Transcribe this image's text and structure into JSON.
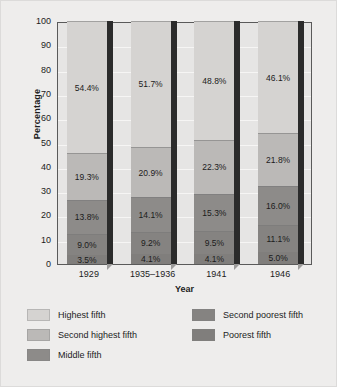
{
  "chart_data": {
    "type": "bar",
    "subtype": "stacked-column-3d",
    "title": "",
    "xlabel": "Year",
    "ylabel": "Percentage",
    "ylim": [
      0,
      100
    ],
    "yticks": [
      0,
      10,
      20,
      30,
      40,
      50,
      60,
      70,
      80,
      90,
      100
    ],
    "ytick_labels": [
      "0",
      "10",
      "20",
      "30",
      "40",
      "50",
      "60",
      "70",
      "80",
      "90",
      "100"
    ],
    "grid": true,
    "legend_position": "bottom",
    "categories": [
      "1929",
      "1935–1936",
      "1941",
      "1946"
    ],
    "series": [
      {
        "name": "Highest fifth",
        "color": "#d5d3d1",
        "values": [
          54.4,
          51.7,
          48.8,
          46.1
        ],
        "labels": [
          "54.4%",
          "51.7%",
          "48.8%",
          "46.1%"
        ]
      },
      {
        "name": "Second highest fifth",
        "color": "#bbb9b7",
        "values": [
          19.3,
          20.9,
          22.3,
          21.8
        ],
        "labels": [
          "19.3%",
          "20.9%",
          "22.3%",
          "21.8%"
        ]
      },
      {
        "name": "Middle fifth",
        "color": "#8d8b89",
        "values": [
          13.8,
          14.1,
          15.3,
          16.0
        ],
        "labels": [
          "13.8%",
          "14.1%",
          "15.3%",
          "16.0%"
        ]
      },
      {
        "name": "Second poorest fifth",
        "color": "#858381",
        "values": [
          9.0,
          9.2,
          9.5,
          11.1
        ],
        "labels": [
          "9.0%",
          "9.2%",
          "9.5%",
          "11.1%"
        ]
      },
      {
        "name": "Poorest fifth",
        "color": "#807e7c",
        "values": [
          3.5,
          4.1,
          4.1,
          5.0
        ],
        "labels": [
          "3.5%",
          "4.1%",
          "4.1%",
          "5.0%"
        ]
      }
    ]
  },
  "legend": {
    "left_column": [
      {
        "label": "Highest fifth",
        "color": "#d5d3d1"
      },
      {
        "label": "Second highest fifth",
        "color": "#bbb9b7"
      },
      {
        "label": "Middle fifth",
        "color": "#8d8b89"
      }
    ],
    "right_column": [
      {
        "label": "Second poorest fifth",
        "color": "#858381"
      },
      {
        "label": "Poorest fifth",
        "color": "#807e7c"
      }
    ]
  },
  "colors": {
    "figure_background": "#eeedec",
    "plot_background": "#e6e5e4",
    "axis_line": "#5a5a5a",
    "gridline": "#f6f5f4",
    "text": "#1c1c1c",
    "bar_shadow": "#2b2b2b"
  }
}
